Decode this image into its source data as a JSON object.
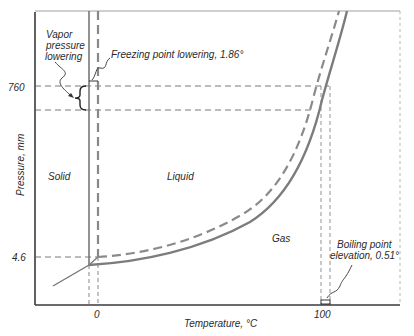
{
  "diagram": {
    "type": "phase-diagram",
    "axes": {
      "x_label": "Temperature, °C",
      "y_label": "Pressure, mm",
      "x_ticks": [
        "0",
        "100"
      ],
      "y_ticks": [
        "760",
        "4.6"
      ]
    },
    "regions": {
      "solid": "Solid",
      "liquid": "Liquid",
      "gas": "Gas"
    },
    "annotations": {
      "vapor_pressure_lowering": [
        "Vapor",
        "pressure",
        "lowering"
      ],
      "freezing_point_lowering": "Freezing point lowering, 1.86°",
      "boiling_point_elevation": [
        "Boiling point",
        "elevation, 0.51°"
      ]
    },
    "series": [
      {
        "name": "pure solvent",
        "style": "solid",
        "color": "#7a7a7a"
      },
      {
        "name": "solution",
        "style": "dashed",
        "color": "#8a8a8a"
      }
    ],
    "colors": {
      "axis": "#3a3a3a",
      "curve": "#7c7c7c",
      "guide": "#555555",
      "text": "#2a2a2a"
    }
  }
}
